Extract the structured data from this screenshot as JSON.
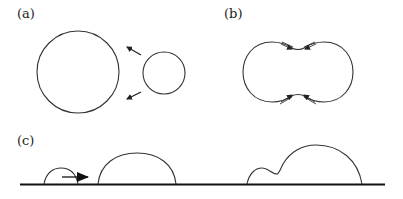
{
  "panels": {
    "a": {
      "label": "(a)",
      "description": "Large circle and small circle approaching; arrows point from small circle toward large circle",
      "large_circle": {
        "cx": 78,
        "cy": 72,
        "r": 41
      },
      "small_circle": {
        "cx": 164,
        "cy": 73,
        "r": 21
      },
      "arrows": [
        {
          "from": [
            141,
            55
          ],
          "to": [
            127,
            47
          ]
        },
        {
          "from": [
            141,
            92
          ],
          "to": [
            127,
            99
          ]
        }
      ]
    },
    "b": {
      "label": "(b)",
      "description": "Two coalescing circles forming a peanut shape with neck; double-line arrows pointing into the neck from top and bottom"
    },
    "c": {
      "label": "(c)",
      "description": "Droplets on a substrate: small droplet moving right toward larger droplet, and merged composite droplet"
    }
  },
  "style": {
    "stroke_color": "#333333",
    "baseline_color": "#111111",
    "background": "#ffffff"
  }
}
